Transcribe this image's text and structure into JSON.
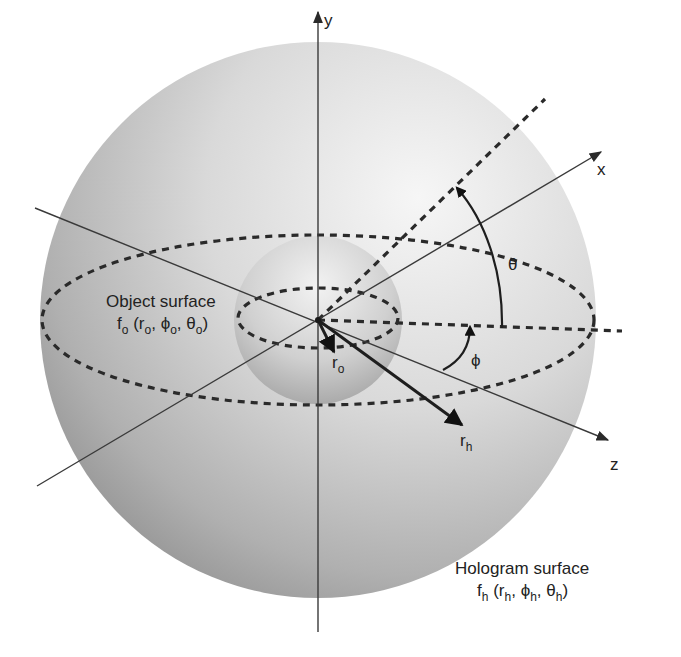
{
  "diagram": {
    "axes": {
      "x_label": "x",
      "y_label": "y",
      "z_label": "z"
    },
    "angles": {
      "theta_symbol": "θ",
      "phi_symbol": "ϕ"
    },
    "vectors": {
      "r_o": {
        "base": "r",
        "sub": "o"
      },
      "r_h": {
        "base": "r",
        "sub": "h"
      }
    },
    "object_surface": {
      "name": "Object surface",
      "func": "f",
      "func_sub": "o",
      "open": " (",
      "r": "r",
      "r_sub": "o",
      "sep1": ", ",
      "phi": "ϕ",
      "phi_sub": "o",
      "sep2": ", ",
      "theta": "θ",
      "theta_sub": "o",
      "close": ")"
    },
    "hologram_surface": {
      "name": "Hologram surface",
      "func": "f",
      "func_sub": "h",
      "open": " (",
      "r": "r",
      "r_sub": "h",
      "sep1": ", ",
      "phi": "ϕ",
      "phi_sub": "h",
      "sep2": ", ",
      "theta": "θ",
      "theta_sub": "h",
      "close": ")"
    },
    "colors": {
      "outer_sphere_edge": "#8c8c8c",
      "outer_sphere_highlight": "#f4f4f4",
      "inner_sphere_edge": "#9a9a9a",
      "inner_sphere_highlight": "#eeeeee",
      "line": "#2a2a2a"
    }
  }
}
